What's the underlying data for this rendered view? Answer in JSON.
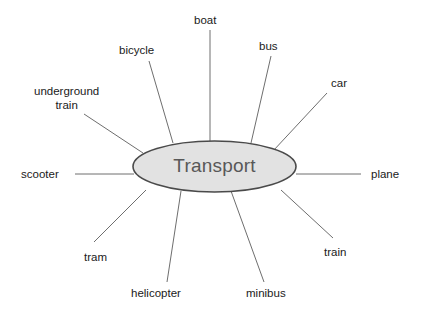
{
  "diagram": {
    "type": "mind-map",
    "title": "Transport",
    "center": {
      "label": "Transport",
      "shape": "ellipse",
      "fill_color": "#e2e2e2",
      "stroke_color": "#4a4a4a",
      "text_color": "#585858",
      "cx": 214.5,
      "cy": 166.5,
      "rx": 81.5,
      "ry": 25.5
    },
    "background_color": "#ffffff",
    "line_color": "#6e6e6e",
    "branches": [
      {
        "id": "boat",
        "label": "boat",
        "label_x": 194,
        "label_y": 13,
        "align": "left",
        "line": {
          "x1": 210,
          "y1": 30,
          "x2": 210,
          "y2": 142
        }
      },
      {
        "id": "bicycle",
        "label": "bicycle",
        "label_x": 119,
        "label_y": 43,
        "align": "left",
        "line": {
          "x1": 149,
          "y1": 61,
          "x2": 173,
          "y2": 143
        }
      },
      {
        "id": "bus",
        "label": "bus",
        "label_x": 259,
        "label_y": 39,
        "align": "left",
        "line": {
          "x1": 271,
          "y1": 56,
          "x2": 251,
          "y2": 143
        }
      },
      {
        "id": "car",
        "label": "car",
        "label_x": 331,
        "label_y": 76,
        "align": "left",
        "line": {
          "x1": 327,
          "y1": 93,
          "x2": 273,
          "y2": 151
        }
      },
      {
        "id": "underground-train",
        "label": "underground\ntrain",
        "label_x": 34,
        "label_y": 84,
        "align": "center",
        "line": {
          "x1": 84,
          "y1": 114,
          "x2": 143,
          "y2": 153
        }
      },
      {
        "id": "scooter",
        "label": "scooter",
        "label_x": 21,
        "label_y": 167,
        "align": "left",
        "line": {
          "x1": 75,
          "y1": 174,
          "x2": 134,
          "y2": 174
        }
      },
      {
        "id": "plane",
        "label": "plane",
        "label_x": 371,
        "label_y": 167,
        "align": "left",
        "line": {
          "x1": 296,
          "y1": 174,
          "x2": 361,
          "y2": 174
        }
      },
      {
        "id": "tram",
        "label": "tram",
        "label_x": 84,
        "label_y": 250,
        "align": "left",
        "line": {
          "x1": 146,
          "y1": 190,
          "x2": 94,
          "y2": 242
        }
      },
      {
        "id": "helicopter",
        "label": "helicopter",
        "label_x": 131,
        "label_y": 286,
        "align": "left",
        "line": {
          "x1": 181,
          "y1": 191,
          "x2": 167,
          "y2": 282
        }
      },
      {
        "id": "minibus",
        "label": "minibus",
        "label_x": 246,
        "label_y": 286,
        "align": "left",
        "line": {
          "x1": 231,
          "y1": 191,
          "x2": 264,
          "y2": 282
        }
      },
      {
        "id": "train",
        "label": "train",
        "label_x": 324,
        "label_y": 245,
        "align": "left",
        "line": {
          "x1": 281,
          "y1": 190,
          "x2": 333,
          "y2": 238
        }
      }
    ]
  }
}
